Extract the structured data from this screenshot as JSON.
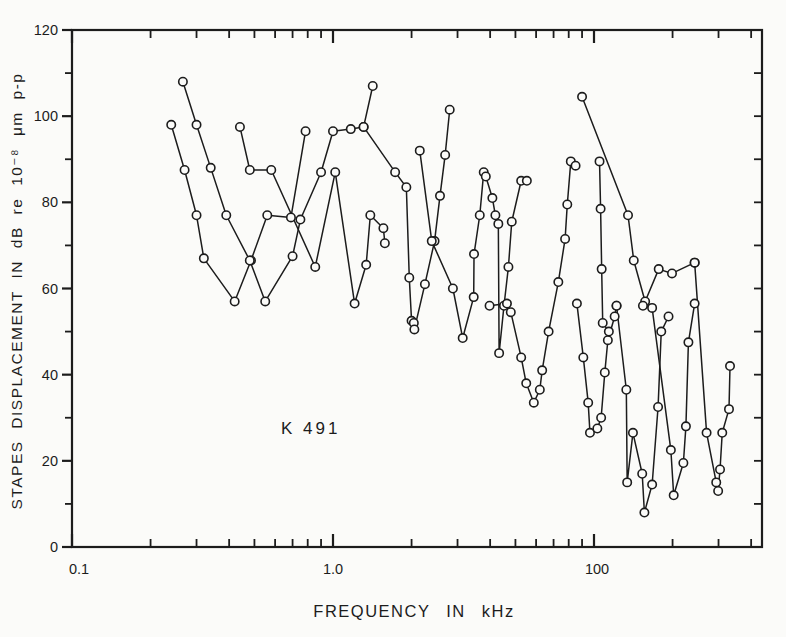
{
  "figure": {
    "paper_color": "#fbfbf9",
    "ink_color": "#1c1c1c"
  },
  "chart_data": {
    "type": "line",
    "title": "",
    "annotation": "K 491",
    "xlabel": "FREQUENCY IN kHz",
    "ylabel": "STAPES DISPLACEMENT IN dB re 10⁻⁸ μm p-p",
    "x_scale": "log",
    "x_tick_labels": [
      "0.1",
      "1.0",
      "100"
    ],
    "x_axis_start": 0.1,
    "x_axis_end_decades": 2.644,
    "y_tick_labels": [
      "0",
      "20",
      "40",
      "60",
      "80",
      "100",
      "120"
    ],
    "ylim": [
      0,
      120
    ],
    "y_minor_step": 10,
    "grid": false,
    "legend": "none",
    "marker": "open-circle",
    "series": [
      {
        "name": "curve-1",
        "points": [
          [
            0.24,
            98
          ],
          [
            0.27,
            87.5
          ],
          [
            0.3,
            77
          ],
          [
            0.32,
            67
          ],
          [
            0.42,
            57
          ],
          [
            0.485,
            66.5
          ],
          [
            0.56,
            77
          ],
          [
            0.69,
            76.5
          ],
          [
            0.785,
            96.5
          ]
        ]
      },
      {
        "name": "curve-2",
        "points": [
          [
            0.266,
            108
          ],
          [
            0.3,
            98
          ],
          [
            0.34,
            88
          ],
          [
            0.39,
            77
          ],
          [
            0.48,
            66.5
          ],
          [
            0.55,
            57
          ],
          [
            0.7,
            67.5
          ],
          [
            0.75,
            76
          ],
          [
            0.9,
            87
          ],
          [
            1.0,
            96.5
          ],
          [
            1.17,
            97
          ],
          [
            1.31,
            97.5
          ],
          [
            1.42,
            107
          ]
        ]
      },
      {
        "name": "curve-3",
        "points": [
          [
            0.44,
            97.5
          ],
          [
            0.48,
            87.5
          ],
          [
            0.58,
            87.5
          ],
          [
            0.855,
            65
          ],
          [
            1.02,
            87
          ],
          [
            1.21,
            56.5
          ],
          [
            1.34,
            65.5
          ],
          [
            1.39,
            77
          ],
          [
            1.56,
            74
          ],
          [
            1.58,
            70.5
          ]
        ]
      },
      {
        "name": "curve-4",
        "points": [
          [
            1.31,
            97.5
          ],
          [
            1.73,
            87
          ],
          [
            1.91,
            83.5
          ],
          [
            1.96,
            62.5
          ],
          [
            2.0,
            52.5
          ],
          [
            2.04,
            52
          ],
          [
            2.05,
            50.5
          ],
          [
            2.25,
            61
          ],
          [
            2.45,
            71
          ],
          [
            2.57,
            81.5
          ],
          [
            2.69,
            91
          ],
          [
            2.8,
            101.5
          ]
        ]
      },
      {
        "name": "curve-5",
        "points": [
          [
            2.15,
            92
          ],
          [
            2.39,
            71
          ],
          [
            2.88,
            60
          ],
          [
            3.14,
            48.5
          ],
          [
            3.46,
            58
          ],
          [
            3.47,
            68
          ],
          [
            3.65,
            77
          ],
          [
            3.78,
            87
          ]
        ]
      },
      {
        "name": "curve-6",
        "points": [
          [
            3.85,
            86
          ],
          [
            4.08,
            81
          ],
          [
            4.19,
            77
          ],
          [
            4.3,
            75
          ],
          [
            4.33,
            45
          ],
          [
            4.52,
            56
          ],
          [
            4.7,
            65
          ],
          [
            4.84,
            75.5
          ],
          [
            5.26,
            85
          ],
          [
            5.53,
            85
          ]
        ]
      },
      {
        "name": "curve-7",
        "points": [
          [
            3.98,
            56
          ],
          [
            4.64,
            56.5
          ],
          [
            4.8,
            54.5
          ],
          [
            5.26,
            44
          ],
          [
            5.5,
            38
          ],
          [
            5.88,
            33.5
          ],
          [
            6.2,
            36.5
          ],
          [
            6.33,
            41
          ],
          [
            6.7,
            50
          ],
          [
            7.3,
            61.5
          ],
          [
            7.75,
            71.5
          ],
          [
            7.9,
            79.5
          ],
          [
            8.15,
            89.5
          ],
          [
            8.5,
            88.5
          ]
        ]
      },
      {
        "name": "curve-8",
        "points": [
          [
            8.6,
            56.5
          ],
          [
            9.1,
            44
          ],
          [
            9.5,
            33.5
          ],
          [
            9.65,
            26.5
          ],
          [
            10.3,
            27.5
          ],
          [
            10.65,
            30
          ],
          [
            11.0,
            40.5
          ],
          [
            11.3,
            48
          ],
          [
            12.0,
            53.5
          ],
          [
            12.2,
            56
          ]
        ]
      },
      {
        "name": "curve-9",
        "points": [
          [
            10.5,
            89.5
          ],
          [
            10.6,
            78.5
          ],
          [
            10.7,
            64.5
          ],
          [
            10.8,
            52
          ],
          [
            11.4,
            50
          ]
        ]
      },
      {
        "name": "curve-10",
        "points": [
          [
            9.0,
            104.5
          ],
          [
            13.5,
            77
          ],
          [
            14.2,
            66.5
          ],
          [
            15.7,
            57
          ],
          [
            17.7,
            64.5
          ],
          [
            19.9,
            63.5
          ],
          [
            24.3,
            66
          ]
        ]
      },
      {
        "name": "curve-11",
        "points": [
          [
            12.2,
            56
          ],
          [
            13.3,
            36.5
          ],
          [
            13.4,
            15
          ],
          [
            14.1,
            26.5
          ],
          [
            15.3,
            17
          ],
          [
            15.6,
            8
          ],
          [
            16.7,
            14.5
          ],
          [
            17.6,
            32.5
          ],
          [
            18.1,
            50
          ],
          [
            19.3,
            53.5
          ]
        ]
      },
      {
        "name": "curve-12",
        "points": [
          [
            15.4,
            56
          ],
          [
            16.7,
            55.5
          ],
          [
            19.7,
            22.5
          ],
          [
            20.2,
            12
          ],
          [
            22.0,
            19.5
          ],
          [
            22.5,
            28
          ],
          [
            23.0,
            47.5
          ],
          [
            24.3,
            56.5
          ]
        ]
      },
      {
        "name": "curve-13",
        "points": [
          [
            24.3,
            66
          ],
          [
            27.0,
            26.5
          ],
          [
            29.4,
            15
          ],
          [
            29.9,
            13
          ],
          [
            30.4,
            18
          ],
          [
            31.0,
            26.5
          ],
          [
            32.9,
            32
          ],
          [
            33.2,
            42
          ]
        ]
      }
    ],
    "layout": {
      "plot_left": 72,
      "plot_right": 762,
      "plot_top": 30,
      "plot_bottom": 547,
      "decade_px": 261
    }
  }
}
